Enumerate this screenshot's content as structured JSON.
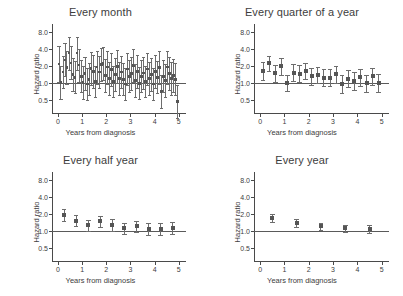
{
  "figure": {
    "axis_labels": {
      "x": "Years from diagnosis",
      "y": "Hazard ratio"
    },
    "yticks": [
      "0.5",
      "1.0",
      "2.0",
      "4.0",
      "8.0"
    ],
    "xticks": [
      "0",
      "1",
      "2",
      "3",
      "4",
      "5"
    ],
    "reference_value": 1.0,
    "colors": {
      "marker": "#555555",
      "error_bar": "#6d6d6d",
      "axis": "#4a4a4a",
      "reference_line": "#5a5a5a",
      "text": "#3d3d3d",
      "background": "#ffffff"
    }
  },
  "chart_data": [
    {
      "type": "scatter",
      "title": "Every month",
      "xlabel": "Years from diagnosis",
      "ylabel": "Hazard ratio",
      "yscale": "log",
      "ylim": [
        0.28,
        11.0
      ],
      "xlim": [
        -0.25,
        5.3
      ],
      "ytick_values": [
        0.5,
        1.0,
        2.0,
        4.0,
        8.0
      ],
      "xtick_values": [
        0,
        1,
        2,
        3,
        4,
        5
      ],
      "grid": false,
      "legend": "none",
      "reference_line_y": 1.0,
      "x": [
        0.04,
        0.12,
        0.21,
        0.29,
        0.37,
        0.46,
        0.54,
        0.62,
        0.71,
        0.79,
        0.87,
        0.96,
        1.04,
        1.12,
        1.21,
        1.29,
        1.37,
        1.46,
        1.54,
        1.62,
        1.71,
        1.79,
        1.87,
        1.96,
        2.04,
        2.12,
        2.21,
        2.29,
        2.37,
        2.46,
        2.54,
        2.62,
        2.71,
        2.79,
        2.87,
        2.96,
        3.04,
        3.12,
        3.21,
        3.29,
        3.37,
        3.46,
        3.54,
        3.62,
        3.71,
        3.79,
        3.87,
        3.96,
        4.04,
        4.12,
        4.21,
        4.29,
        4.37,
        4.46,
        4.54,
        4.62,
        4.71,
        4.79,
        4.87,
        4.96
      ],
      "hr": [
        2.15,
        1.0,
        1.55,
        2.55,
        1.85,
        3.35,
        2.25,
        1.4,
        1.25,
        3.35,
        2.05,
        1.3,
        1.0,
        1.45,
        0.95,
        1.15,
        1.8,
        1.6,
        1.05,
        1.9,
        1.55,
        2.1,
        2.2,
        1.35,
        1.9,
        1.2,
        1.7,
        1.05,
        1.4,
        1.95,
        1.2,
        1.55,
        1.15,
        0.95,
        1.75,
        1.3,
        1.45,
        2.0,
        1.1,
        1.6,
        0.98,
        1.3,
        1.5,
        1.05,
        1.75,
        1.2,
        1.4,
        0.95,
        1.6,
        1.25,
        1.85,
        0.7,
        1.3,
        1.1,
        1.9,
        1.45,
        1.2,
        1.35,
        1.15,
        0.47
      ],
      "ci_low": [
        1.05,
        0.52,
        0.8,
        1.3,
        0.95,
        1.7,
        1.15,
        0.72,
        0.65,
        1.7,
        1.05,
        0.68,
        0.52,
        0.75,
        0.5,
        0.6,
        0.92,
        0.82,
        0.55,
        0.97,
        0.8,
        1.07,
        1.12,
        0.7,
        0.97,
        0.62,
        0.87,
        0.55,
        0.72,
        1.0,
        0.62,
        0.8,
        0.6,
        0.5,
        0.9,
        0.68,
        0.75,
        1.02,
        0.57,
        0.82,
        0.51,
        0.68,
        0.77,
        0.55,
        0.9,
        0.62,
        0.72,
        0.5,
        0.82,
        0.65,
        0.95,
        0.36,
        0.68,
        0.57,
        0.97,
        0.75,
        0.62,
        0.7,
        0.6,
        0.24
      ],
      "ci_high": [
        4.4,
        1.95,
        3.0,
        5.0,
        3.6,
        6.6,
        4.4,
        2.72,
        2.42,
        6.6,
        4.0,
        2.52,
        1.95,
        2.82,
        1.82,
        2.22,
        3.5,
        3.12,
        2.02,
        3.7,
        3.0,
        4.1,
        4.3,
        2.62,
        3.7,
        2.32,
        3.32,
        2.02,
        2.72,
        3.8,
        2.32,
        3.0,
        2.22,
        1.82,
        3.4,
        2.52,
        2.82,
        3.92,
        2.12,
        3.12,
        1.88,
        2.52,
        2.92,
        2.02,
        3.4,
        2.32,
        2.72,
        1.82,
        3.12,
        2.42,
        3.6,
        1.36,
        2.52,
        2.12,
        3.7,
        2.82,
        2.32,
        2.62,
        2.22,
        0.92
      ]
    },
    {
      "type": "scatter",
      "title": "Every quarter of a year",
      "xlabel": "Years from diagnosis",
      "ylabel": "Hazard ratio",
      "yscale": "log",
      "ylim": [
        0.28,
        11.0
      ],
      "xlim": [
        -0.25,
        5.3
      ],
      "ytick_values": [
        0.5,
        1.0,
        2.0,
        4.0,
        8.0
      ],
      "xtick_values": [
        0,
        1,
        2,
        3,
        4,
        5
      ],
      "grid": false,
      "legend": "none",
      "reference_line_y": 1.0,
      "x": [
        0.125,
        0.375,
        0.625,
        0.875,
        1.125,
        1.375,
        1.625,
        1.875,
        2.125,
        2.375,
        2.625,
        2.875,
        3.125,
        3.375,
        3.625,
        3.875,
        4.125,
        4.375,
        4.625,
        4.875
      ],
      "hr": [
        1.62,
        2.2,
        1.48,
        1.95,
        1.0,
        1.52,
        1.45,
        1.62,
        1.3,
        1.38,
        1.22,
        1.22,
        1.42,
        0.95,
        1.18,
        1.08,
        1.25,
        0.98,
        1.3,
        1.0
      ],
      "ci_low": [
        1.12,
        1.6,
        1.05,
        1.4,
        0.72,
        1.08,
        1.03,
        1.15,
        0.92,
        0.98,
        0.86,
        0.86,
        1.0,
        0.67,
        0.83,
        0.76,
        0.88,
        0.69,
        0.91,
        0.7
      ],
      "ci_high": [
        2.35,
        3.02,
        2.08,
        2.72,
        1.39,
        2.14,
        2.04,
        2.28,
        1.84,
        1.94,
        1.73,
        1.73,
        2.02,
        1.35,
        1.68,
        1.53,
        1.78,
        1.39,
        1.86,
        1.43
      ]
    },
    {
      "type": "scatter",
      "title": "Every half year",
      "xlabel": "Years from diagnosis",
      "ylabel": "Hazard ratio",
      "yscale": "log",
      "ylim": [
        0.28,
        11.0
      ],
      "xlim": [
        -0.25,
        5.3
      ],
      "ytick_values": [
        0.5,
        1.0,
        2.0,
        4.0,
        8.0
      ],
      "xtick_values": [
        0,
        1,
        2,
        3,
        4,
        5
      ],
      "grid": false,
      "legend": "none",
      "reference_line_y": 1.0,
      "x": [
        0.25,
        0.75,
        1.25,
        1.75,
        2.25,
        2.75,
        3.25,
        3.75,
        4.25,
        4.75
      ],
      "hr": [
        1.9,
        1.52,
        1.25,
        1.48,
        1.28,
        1.1,
        1.2,
        1.08,
        1.08,
        1.12
      ],
      "ci_low": [
        1.48,
        1.2,
        0.99,
        1.18,
        1.01,
        0.87,
        0.95,
        0.85,
        0.85,
        0.88
      ],
      "ci_high": [
        2.44,
        1.93,
        1.58,
        1.86,
        1.62,
        1.39,
        1.52,
        1.37,
        1.37,
        1.43
      ]
    },
    {
      "type": "scatter",
      "title": "Every year",
      "xlabel": "Years from diagnosis",
      "ylabel": "Hazard ratio",
      "yscale": "log",
      "ylim": [
        0.28,
        11.0
      ],
      "xlim": [
        -0.25,
        5.3
      ],
      "ytick_values": [
        0.5,
        1.0,
        2.0,
        4.0,
        8.0
      ],
      "xtick_values": [
        0,
        1,
        2,
        3,
        4,
        5
      ],
      "grid": false,
      "legend": "none",
      "reference_line_y": 1.0,
      "x": [
        0.5,
        1.5,
        2.5,
        3.5,
        4.5
      ],
      "hr": [
        1.7,
        1.38,
        1.2,
        1.1,
        1.08
      ],
      "ci_low": [
        1.44,
        1.18,
        1.03,
        0.94,
        0.92
      ],
      "ci_high": [
        2.0,
        1.62,
        1.4,
        1.29,
        1.27
      ]
    }
  ]
}
